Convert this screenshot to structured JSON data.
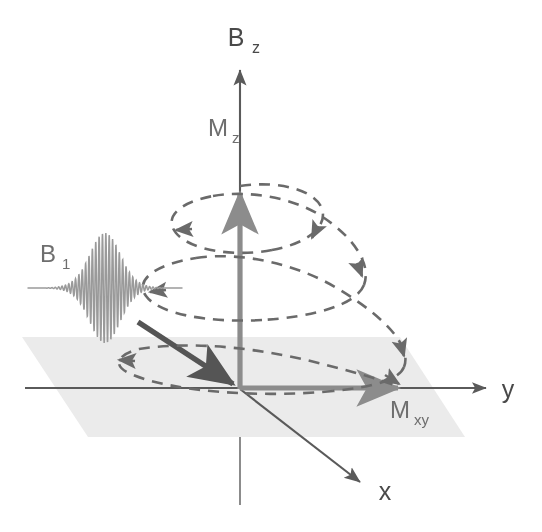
{
  "figure": {
    "background_color": "#ffffff"
  },
  "colors": {
    "axis": "#5a5a5a",
    "axis_label": "#4a4a4a",
    "magnetization_vector": "#8c8c8c",
    "magnetization_label": "#6e6e6e",
    "rf_pulse": "#9a9a9a",
    "spiral": "#6b6b6b",
    "plane_fill": "#ebebeb",
    "x_axis_thick": "#555555"
  },
  "axes": [
    {
      "name": "z-axis",
      "label": "B",
      "subscript": "z",
      "label_x": 236,
      "label_y": 46,
      "sub_x": 253,
      "sub_y": 53,
      "direction": "vertical-up",
      "tip": [
        240,
        62
      ],
      "origin": [
        240,
        389
      ],
      "extends_below_plane_to": 505
    },
    {
      "name": "y-axis",
      "label": "y",
      "subscript": "",
      "label_x": 508,
      "label_y": 398,
      "direction": "horizontal-right",
      "start": [
        25,
        388
      ],
      "tip": [
        492,
        388
      ]
    },
    {
      "name": "x-axis",
      "label": "x",
      "subscript": "",
      "label_x": 385,
      "label_y": 500,
      "direction": "diagonal-down-right",
      "start": [
        240,
        389
      ],
      "tip": [
        366,
        487
      ]
    }
  ],
  "vectors": [
    {
      "name": "mz-vector",
      "label": "M",
      "subscript": "z",
      "label_x": 218,
      "label_y": 136,
      "sub_x": 237,
      "sub_y": 143,
      "description": "longitudinal magnetization along z",
      "from": [
        240,
        389
      ],
      "to": [
        240,
        185
      ]
    },
    {
      "name": "mxy-vector",
      "label": "M",
      "subscript": "xy",
      "label_x": 398,
      "label_y": 418,
      "sub_x": 416,
      "sub_y": 425,
      "description": "transverse magnetization in xy-plane",
      "from": [
        240,
        389
      ],
      "to": [
        406,
        388
      ]
    },
    {
      "name": "minus-x-vector",
      "label": "",
      "subscript": "",
      "description": "thick dark vector toward origin from upper left",
      "from": [
        138,
        322
      ],
      "to": [
        240,
        389
      ]
    }
  ],
  "rf_pulse": {
    "name": "b1-rf-pulse",
    "label": "B",
    "subscript": "1",
    "label_x": 38,
    "label_y": 262,
    "sub_x": 56,
    "sub_y": 269,
    "description": "amplitude modulated RF excitation wavepacket",
    "center_x": 105,
    "baseline_y": 288,
    "peak_amplitude": 55,
    "width": 155,
    "cycles": 46
  },
  "plane": {
    "name": "xy-plane",
    "description": "shaded transverse xy-plane parallelogram",
    "points": "22,337 400,337 465,437 88,437"
  },
  "spiral": {
    "name": "precession-spiral",
    "description": "dashed helical trajectory of magnetization from +z spiralling down to xy-plane",
    "turns": 3,
    "start": [
      240,
      186
    ],
    "end": [
      406,
      388
    ],
    "center_x": 240,
    "rx_start": 70,
    "rx_end": 168,
    "ry_start": 20,
    "ry_end": 30,
    "dash_pattern": "11 8",
    "direction_arrow_count": 6
  },
  "chart_data": {
    "type": "diagram",
    "elements": [
      "B_z axis",
      "M_z vector",
      "M_xy vector",
      "B_1 RF pulse",
      "xy-plane",
      "precession spiral",
      "x axis",
      "y axis"
    ]
  }
}
